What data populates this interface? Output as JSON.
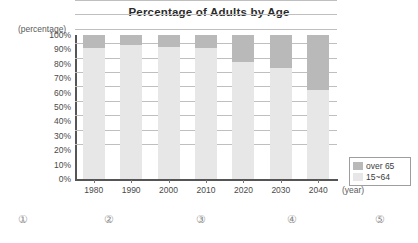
{
  "chart_data": {
    "type": "bar",
    "title": "Percentage of Adults by Age",
    "xlabel": "(year)",
    "ylabel": "(percentage)",
    "ylim": [
      0,
      100
    ],
    "grid": true,
    "stacked": true,
    "legend_position": "bottom-right",
    "categories": [
      "1980",
      "1990",
      "2000",
      "2010",
      "2020",
      "2030",
      "2040"
    ],
    "series": [
      {
        "name": "15~64",
        "color": "#e7e7e7",
        "values": [
          91,
          93,
          92,
          91,
          81,
          77,
          62
        ]
      },
      {
        "name": "over 65",
        "color": "#b9b9b9",
        "values": [
          9,
          7,
          8,
          9,
          19,
          23,
          38
        ]
      }
    ],
    "y_ticks": [
      "100%",
      "90%",
      "80%",
      "70%",
      "60%",
      "50%",
      "40%",
      "30%",
      "20%",
      "10%",
      "0%"
    ],
    "x_ticks": [
      "1980",
      "1990",
      "2000",
      "2010",
      "2020",
      "2030",
      "2040"
    ]
  },
  "legend": {
    "items": [
      {
        "label": "over 65",
        "color": "#b9b9b9"
      },
      {
        "label": "15~64",
        "color": "#e7e7e7"
      }
    ]
  },
  "choices": [
    {
      "label": "①"
    },
    {
      "label": "②"
    },
    {
      "label": "③"
    },
    {
      "label": "④"
    },
    {
      "label": "⑤"
    }
  ]
}
